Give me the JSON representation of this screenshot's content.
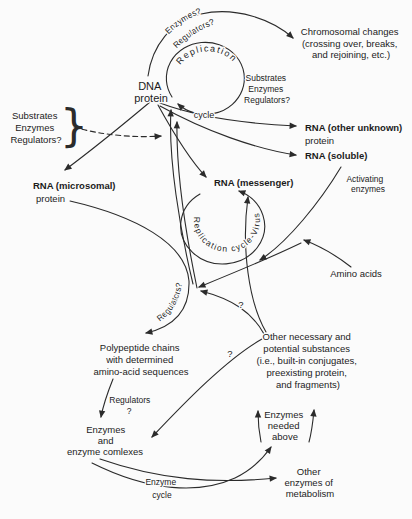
{
  "colors": {
    "ink": "#2b2b2b",
    "background": "#fbfbfb"
  },
  "labels": {
    "replication": "Replication",
    "cycle_top": "cycle",
    "enzymes_q_arc": "Enzymes?",
    "regulators_q_arc": "Regulators?",
    "chromosomal": [
      "Chromosomal changes",
      "(crossing over, breaks,",
      "and rejoining, etc.)"
    ],
    "substrates_inner": [
      "Substrates",
      "Enzymes",
      "Regulators?"
    ],
    "dna": [
      "DNA",
      "protein"
    ],
    "substrates_left": [
      "Substrates",
      "Enzymes",
      "Regulators?"
    ],
    "brace": "}",
    "rna_other": [
      "RNA (other unknown)",
      "protein"
    ],
    "rna_soluble": "RNA (soluble)",
    "rna_messenger": "RNA (messenger)",
    "rna_microsomal": [
      "RNA (microsomal)",
      "protein"
    ],
    "virus_cycle": "Replication cycle-Virus",
    "activating": [
      "Activating",
      "enzymes"
    ],
    "amino_acids": "Amino acids",
    "regulators_curve": "Regulators?",
    "q_upper": "?",
    "q_lower": "?",
    "polypeptide": [
      "Polypeptide chains",
      "with determined",
      "amino-acid sequences"
    ],
    "other_necessary": [
      "Other necessary and",
      "potential substances",
      "(i.e., built-in conjugates,",
      "preexisting protein,",
      "and fragments)"
    ],
    "regulators_mid": [
      "Regulators",
      "?"
    ],
    "enzymes_complexes": [
      "Enzymes",
      "and",
      "enzyme comlexes"
    ],
    "enzymes_needed": [
      "Enzymes",
      "needed",
      "above"
    ],
    "other_enzymes": [
      "Other",
      "enzymes of",
      "metabolism"
    ],
    "enzyme_cycle": [
      "Enzyme",
      "cycle"
    ]
  }
}
